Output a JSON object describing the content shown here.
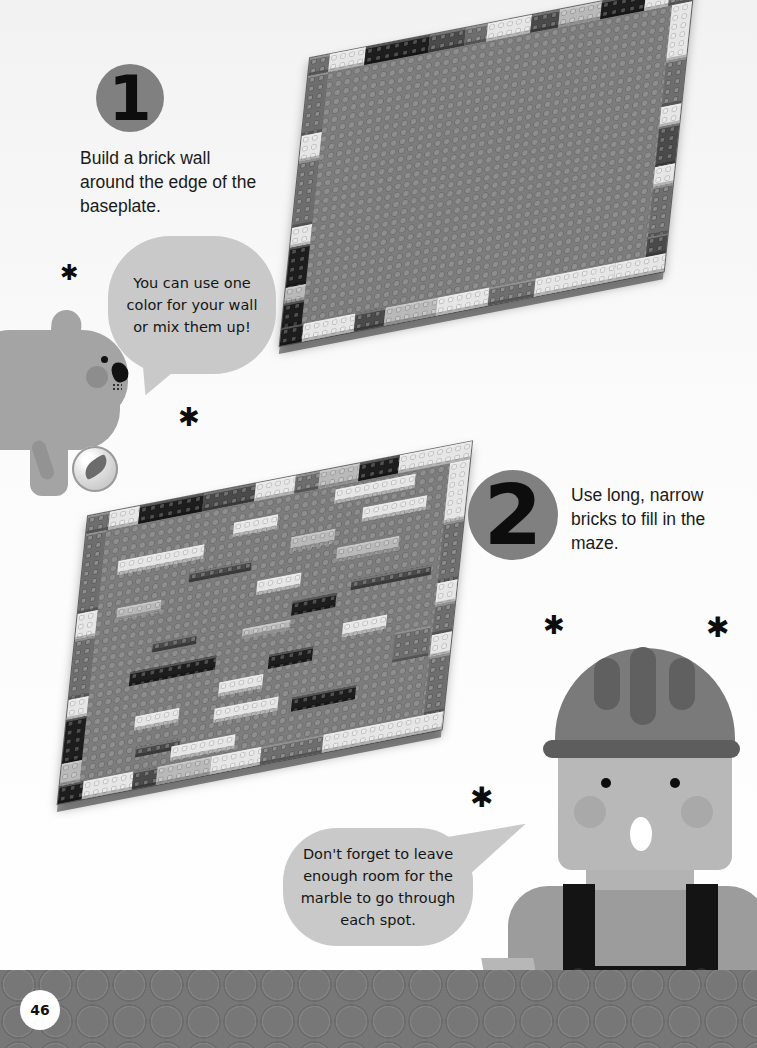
{
  "page": {
    "page_number": "46",
    "background": "#ffffff",
    "footer_color": "#777777"
  },
  "steps": [
    {
      "number": "1",
      "text": "Build a brick wall around the edge of the baseplate."
    },
    {
      "number": "2",
      "text": "Use long, narrow bricks to fill in the maze."
    }
  ],
  "bubbles": {
    "dog": "You can use one color for your wall or mix them up!",
    "worker": "Don't forget to leave enough room for the marble to go through each spot."
  },
  "decorations": {
    "star_glyph": "✱"
  },
  "images": {
    "plate1": "baseplate-with-brick-wall",
    "plate2": "baseplate-maze"
  },
  "colors": {
    "badge": "#808080",
    "bubble": "#c9c9c9",
    "baseplate": "#7d7d7d",
    "overalls": "#141414"
  }
}
